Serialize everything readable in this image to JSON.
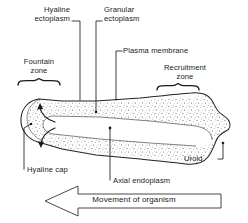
{
  "figure": {
    "labels": {
      "hyaline_ectoplasm": "Hyaline\nectoplasm",
      "hyaline_ectoplasm_line1": "Hyaline",
      "hyaline_ectoplasm_line2": "ectoplasm",
      "granular_ectoplasm_line1": "Granular",
      "granular_ectoplasm_line2": "ectoplasm",
      "plasma_membrane": "Plasma membrane",
      "fountain_zone_line1": "Fountain",
      "fountain_zone_line2": "zone",
      "recruitment_zone_line1": "Recruitment",
      "recruitment_zone_line2": "zone",
      "hyaline_cap": "Hyaline cap",
      "axial_endoplasm": "Axial endoplasm",
      "uroid": "Uroid",
      "movement": "Movement of organism"
    },
    "colors": {
      "ink": "#1a1a1a",
      "outline": "#222222",
      "stipple": "#555555",
      "background": "#ffffff"
    },
    "parts": [
      "hyaline ectoplasm",
      "granular ectoplasm",
      "plasma membrane",
      "fountain zone",
      "recruitment zone",
      "hyaline cap",
      "axial endoplasm",
      "uroid"
    ],
    "direction_of_movement": "leftward"
  }
}
